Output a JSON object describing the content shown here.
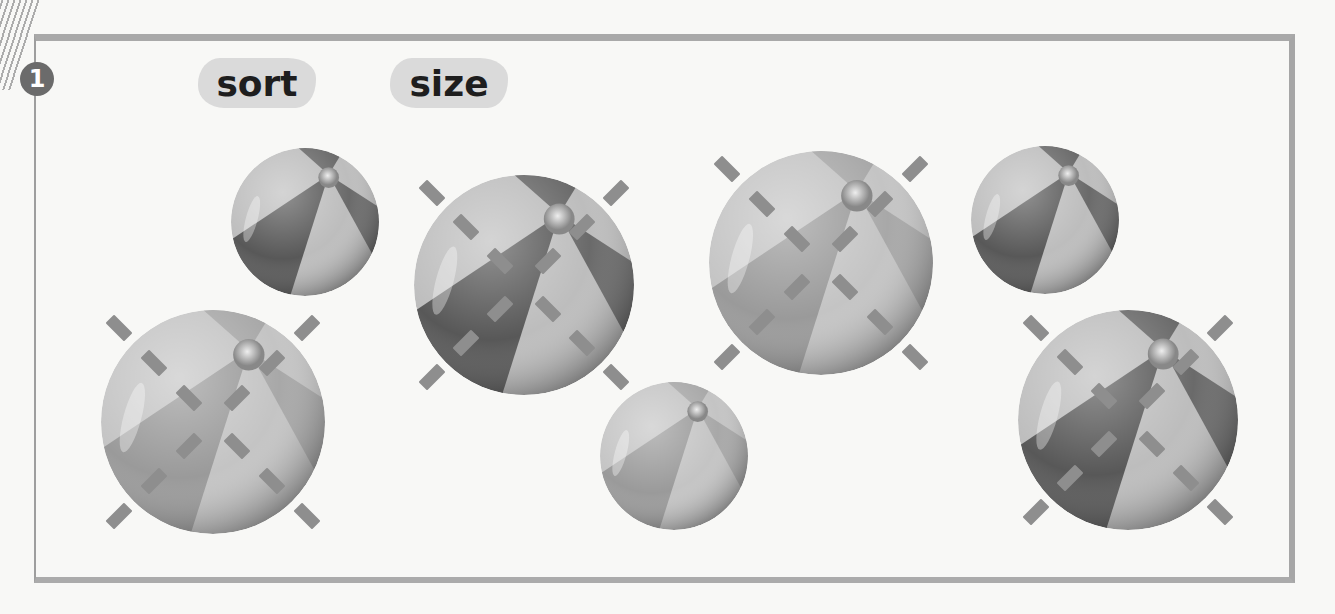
{
  "exercise": {
    "number": "1",
    "words": [
      {
        "id": "sort",
        "label": "sort"
      },
      {
        "id": "size",
        "label": "size"
      }
    ]
  },
  "balls": [
    {
      "id": 1,
      "size": "small",
      "shade": "dark",
      "cx": 305,
      "cy": 222,
      "r": 74,
      "marked": false
    },
    {
      "id": 2,
      "size": "large",
      "shade": "light",
      "cx": 213,
      "cy": 422,
      "r": 112,
      "marked": true
    },
    {
      "id": 3,
      "size": "large",
      "shade": "dark",
      "cx": 524,
      "cy": 285,
      "r": 110,
      "marked": true
    },
    {
      "id": 4,
      "size": "small",
      "shade": "light",
      "cx": 674,
      "cy": 456,
      "r": 74,
      "marked": false
    },
    {
      "id": 5,
      "size": "large",
      "shade": "light",
      "cx": 821,
      "cy": 263,
      "r": 112,
      "marked": true
    },
    {
      "id": 6,
      "size": "small",
      "shade": "dark",
      "cx": 1045,
      "cy": 220,
      "r": 74,
      "marked": false
    },
    {
      "id": 7,
      "size": "large",
      "shade": "dark",
      "cx": 1128,
      "cy": 420,
      "r": 110,
      "marked": true
    }
  ],
  "colors": {
    "frame": "#a9a9a9",
    "badge": "#6b6b6b",
    "word_blob": "#dadada",
    "tick_mark": "#8e8e8e",
    "dark_panel": "#555555",
    "light_panel": "#c8c8c8"
  }
}
